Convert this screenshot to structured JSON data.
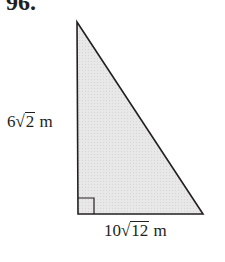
{
  "problem": {
    "number": "96."
  },
  "figure": {
    "shape": "right-triangle",
    "fill_color": "#e6e6e6",
    "stroke_color": "#231f20",
    "vertices": {
      "top": [
        77,
        22
      ],
      "right_angle": [
        78,
        214
      ],
      "right": [
        203,
        214
      ]
    },
    "right_angle_marker": true
  },
  "labels": {
    "left_side": {
      "coefficient": "6",
      "radical_sign": "√",
      "radicand": "2",
      "unit": " m"
    },
    "bottom_side": {
      "coefficient": "10",
      "radical_sign": "√",
      "radicand": "12",
      "unit": " m"
    }
  }
}
